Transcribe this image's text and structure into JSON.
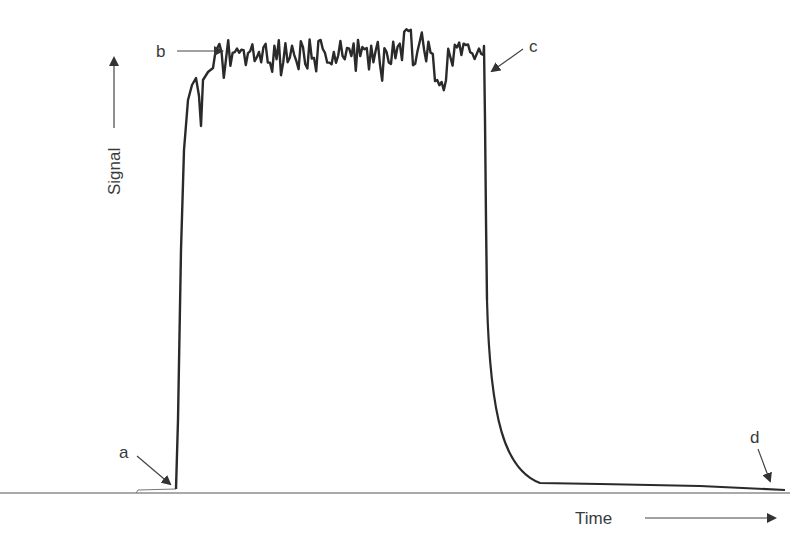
{
  "chart_data": {
    "type": "line",
    "title": "",
    "xlabel": "Time",
    "ylabel": "Signal",
    "xlim": [
      0,
      100
    ],
    "ylim": [
      0,
      100
    ],
    "grid": false,
    "legend": null,
    "axis_ticks": "none (qualitative axes with direction arrows)",
    "series": [
      {
        "name": "Signal",
        "color": "#2a2a2a",
        "x": [
          0,
          5,
          6,
          6.5,
          7,
          8,
          9,
          10,
          12,
          15,
          20,
          25,
          30,
          35,
          40,
          45,
          48,
          50,
          51,
          52,
          53,
          55,
          60,
          70,
          80,
          90,
          100
        ],
        "y": [
          0.3,
          0.8,
          2,
          40,
          80,
          88,
          90,
          93,
          96,
          97,
          96,
          95,
          97,
          96,
          98,
          95,
          96,
          96,
          40,
          15,
          6,
          1.8,
          1.4,
          1.2,
          1.0,
          0.8,
          0.6
        ]
      }
    ],
    "annotations": [
      {
        "label": "a",
        "x": 6,
        "y": 1,
        "meaning": "onset of signal rise"
      },
      {
        "label": "b",
        "x": 10,
        "y": 93,
        "meaning": "steady-state plateau"
      },
      {
        "label": "c",
        "x": 50,
        "y": 96,
        "meaning": "signal cut-off / start of decay"
      },
      {
        "label": "d",
        "x": 98,
        "y": 0.6,
        "meaning": "return toward baseline"
      }
    ]
  },
  "labels": {
    "ylabel": "Signal",
    "xlabel": "Time",
    "a": "a",
    "b": "b",
    "c": "c",
    "d": "d"
  },
  "colors": {
    "line": "#2a2a2a",
    "axis": "#555555",
    "text": "#3a3a3a"
  }
}
